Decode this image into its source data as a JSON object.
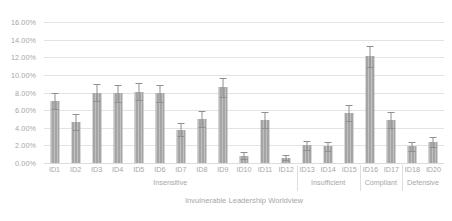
{
  "chart_data": {
    "type": "bar",
    "title": "",
    "xlabel": "Invulnerable Leadership Worldview",
    "ylabel": "",
    "ylim": [
      0,
      16
    ],
    "yticks": [
      "0.00%",
      "2.00%",
      "4.00%",
      "6.00%",
      "8.00%",
      "10.00%",
      "12.00%",
      "14.00%",
      "16.00%"
    ],
    "ytick_values": [
      0,
      2,
      4,
      6,
      8,
      10,
      12,
      14,
      16
    ],
    "grid": true,
    "legend": "none",
    "value_unit": "percent",
    "categories": [
      "ID1",
      "ID2",
      "ID3",
      "ID4",
      "ID5",
      "ID6",
      "ID7",
      "ID8",
      "ID9",
      "ID10",
      "ID11",
      "ID12",
      "ID13",
      "ID14",
      "ID15",
      "ID16",
      "ID17",
      "ID18",
      "ID20"
    ],
    "values": [
      7.0,
      4.7,
      8.0,
      7.9,
      8.1,
      7.9,
      3.8,
      5.0,
      8.6,
      0.8,
      4.9,
      0.6,
      2.0,
      1.9,
      5.7,
      12.1,
      4.9,
      1.9,
      2.4
    ],
    "error_upper": [
      0.9,
      0.9,
      1.0,
      1.0,
      1.0,
      1.0,
      0.7,
      0.9,
      1.1,
      0.4,
      0.9,
      0.3,
      0.5,
      0.5,
      0.9,
      1.2,
      0.9,
      0.5,
      0.6
    ],
    "error_lower": [
      0.9,
      0.9,
      1.0,
      1.0,
      1.0,
      1.0,
      0.7,
      0.9,
      1.1,
      0.4,
      0.9,
      0.3,
      0.5,
      0.5,
      0.9,
      1.2,
      0.9,
      0.5,
      0.6
    ],
    "groups": [
      {
        "label": "Insensitive",
        "start_index": 0,
        "end_index": 11
      },
      {
        "label": "Insufficient",
        "start_index": 12,
        "end_index": 14
      },
      {
        "label": "Compliant",
        "start_index": 15,
        "end_index": 16
      },
      {
        "label": "Defensive",
        "start_index": 17,
        "end_index": 18
      }
    ],
    "colors": {
      "bar_fill": "#a5a5a5",
      "error_bar": "#8f8f8f",
      "gridline": "#e3e3e3",
      "text": "#a6a6a6",
      "background": "#ffffff"
    }
  }
}
